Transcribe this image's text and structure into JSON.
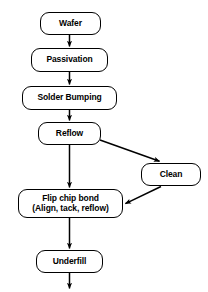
{
  "diagram": {
    "type": "flowchart",
    "background_color": "#ffffff",
    "line_color": "#000000",
    "text_color": "#000000",
    "box_fill": "#ffffff",
    "nodes": [
      {
        "id": "wafer",
        "label": "Wafer",
        "shape": "rounded-rectangle",
        "x": 40,
        "y": 12,
        "width": 61,
        "height": 23,
        "font_size": 8.5
      },
      {
        "id": "passivation",
        "label": "Passivation",
        "shape": "rounded-rectangle",
        "x": 31,
        "y": 48,
        "width": 77,
        "height": 24,
        "font_size": 8.5
      },
      {
        "id": "solder-bumping",
        "label": "Solder Bumping",
        "shape": "rounded-rectangle",
        "x": 22,
        "y": 86,
        "width": 95,
        "height": 24,
        "font_size": 8.5
      },
      {
        "id": "reflow",
        "label": "Reflow",
        "shape": "rounded-rectangle",
        "x": 38,
        "y": 122,
        "width": 63,
        "height": 23,
        "font_size": 8.5
      },
      {
        "id": "clean",
        "label": "Clean",
        "shape": "rounded-rectangle",
        "x": 141,
        "y": 163,
        "width": 60,
        "height": 23,
        "font_size": 8.5
      },
      {
        "id": "flip-chip-bond",
        "label": "Flip chip bond\n(Align, tack, reflow)",
        "shape": "rounded-rectangle",
        "x": 18,
        "y": 189,
        "width": 105,
        "height": 29,
        "font_size": 8.5
      },
      {
        "id": "underfill",
        "label": "Underfill",
        "shape": "rounded-rectangle",
        "x": 36,
        "y": 250,
        "width": 67,
        "height": 23,
        "font_size": 8.5
      }
    ],
    "edges": [
      {
        "id": "wafer-to-passivation",
        "from": "wafer",
        "to": "passivation",
        "style": "straight-vertical",
        "arrowhead": true
      },
      {
        "id": "passivation-to-solder-bumping",
        "from": "passivation",
        "to": "solder-bumping",
        "style": "straight-vertical",
        "arrowhead": true
      },
      {
        "id": "solder-bumping-to-reflow",
        "from": "solder-bumping",
        "to": "reflow",
        "style": "straight-vertical",
        "arrowhead": true
      },
      {
        "id": "reflow-to-clean",
        "from": "reflow",
        "to": "clean",
        "style": "diagonal",
        "arrowhead": true
      },
      {
        "id": "reflow-to-flip-chip-bond",
        "from": "reflow",
        "to": "flip-chip-bond",
        "style": "straight-vertical",
        "arrowhead": true
      },
      {
        "id": "clean-to-flip-chip-bond",
        "from": "clean",
        "to": "flip-chip-bond",
        "style": "diagonal",
        "arrowhead": true
      },
      {
        "id": "flip-chip-bond-to-underfill",
        "from": "flip-chip-bond",
        "to": "underfill",
        "style": "straight-vertical",
        "arrowhead": true
      },
      {
        "id": "underfill-to-next",
        "from": "underfill",
        "to": null,
        "style": "straight-vertical",
        "arrowhead": true
      }
    ]
  }
}
